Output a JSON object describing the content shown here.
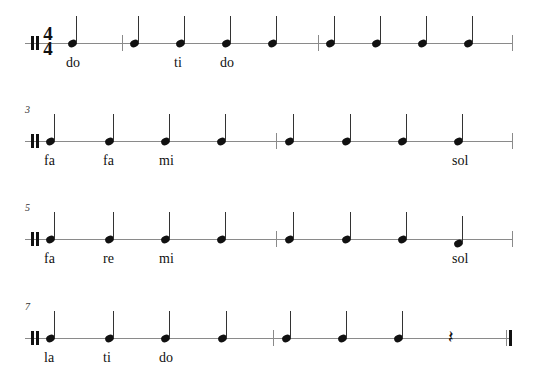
{
  "score": {
    "time_signature": {
      "top": "4",
      "bottom": "4"
    },
    "systems": [
      {
        "measure_number": "",
        "staff_y": 43,
        "barlines": [
          122,
          318
        ],
        "end_x": 512,
        "final": false,
        "events": [
          {
            "type": "note",
            "x": 68,
            "syllable": "do"
          },
          {
            "type": "note",
            "x": 130,
            "syllable": ""
          },
          {
            "type": "note",
            "x": 176,
            "syllable": "ti"
          },
          {
            "type": "note",
            "x": 222,
            "syllable": "do"
          },
          {
            "type": "note",
            "x": 268,
            "syllable": ""
          },
          {
            "type": "note",
            "x": 326,
            "syllable": ""
          },
          {
            "type": "note",
            "x": 372,
            "syllable": ""
          },
          {
            "type": "note",
            "x": 418,
            "syllable": ""
          },
          {
            "type": "note",
            "x": 464,
            "syllable": ""
          }
        ]
      },
      {
        "measure_number": "3",
        "staff_y": 141,
        "barlines": [
          276
        ],
        "end_x": 512,
        "final": false,
        "events": [
          {
            "type": "note",
            "x": 46,
            "syllable": "fa"
          },
          {
            "type": "note",
            "x": 105,
            "syllable": "fa"
          },
          {
            "type": "note",
            "x": 161,
            "syllable": "mi"
          },
          {
            "type": "note",
            "x": 217,
            "syllable": ""
          },
          {
            "type": "note",
            "x": 285,
            "syllable": ""
          },
          {
            "type": "note",
            "x": 342,
            "syllable": ""
          },
          {
            "type": "note",
            "x": 398,
            "syllable": ""
          },
          {
            "type": "note",
            "x": 454,
            "syllable": "sol"
          }
        ]
      },
      {
        "measure_number": "5",
        "staff_y": 239,
        "barlines": [
          276
        ],
        "end_x": 512,
        "final": false,
        "events": [
          {
            "type": "note",
            "x": 46,
            "syllable": "fa"
          },
          {
            "type": "note",
            "x": 105,
            "syllable": "re"
          },
          {
            "type": "note",
            "x": 161,
            "syllable": "mi"
          },
          {
            "type": "note",
            "x": 217,
            "syllable": ""
          },
          {
            "type": "note",
            "x": 285,
            "syllable": ""
          },
          {
            "type": "note",
            "x": 342,
            "syllable": ""
          },
          {
            "type": "note",
            "x": 398,
            "syllable": ""
          },
          {
            "type": "note",
            "x": 454,
            "syllable": "sol",
            "offset": 4
          }
        ]
      },
      {
        "measure_number": "7",
        "staff_y": 338,
        "barlines": [
          273
        ],
        "end_x": 512,
        "final": true,
        "events": [
          {
            "type": "note",
            "x": 46,
            "syllable": "la"
          },
          {
            "type": "note",
            "x": 105,
            "syllable": "ti"
          },
          {
            "type": "note",
            "x": 161,
            "syllable": "do"
          },
          {
            "type": "note",
            "x": 218,
            "syllable": ""
          },
          {
            "type": "note",
            "x": 282,
            "syllable": ""
          },
          {
            "type": "note",
            "x": 338,
            "syllable": ""
          },
          {
            "type": "note",
            "x": 394,
            "syllable": ""
          },
          {
            "type": "rest",
            "x": 448,
            "syllable": "",
            "glyph": "𝄽"
          }
        ]
      }
    ]
  }
}
